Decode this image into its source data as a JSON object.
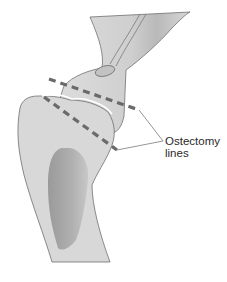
{
  "diagram": {
    "label_line1": "Ostectomy",
    "label_line2": "lines",
    "colors": {
      "bone_fill": "#d6d6d6",
      "bone_outline": "#6e6e6e",
      "cavity_fill": "#a9a9a9",
      "cut_line": "#6a6a6a",
      "leader": "#7a7a7a",
      "background": "#ffffff"
    },
    "elements": [
      "upper-bone",
      "lower-bone",
      "medullary-cavity",
      "nutrient-foramen",
      "ostectomy-line-upper",
      "ostectomy-line-lower",
      "leader-lines"
    ]
  }
}
